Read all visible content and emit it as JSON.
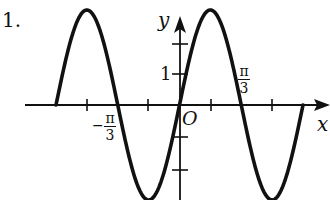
{
  "problem_label": "1.",
  "axes": {
    "x_label": "x",
    "y_label": "y",
    "origin_label": "O",
    "y_tick_label": "1",
    "x_tick_labels": [
      {
        "sign": "",
        "numerator": "π",
        "denominator": "3"
      },
      {
        "sign": "−",
        "numerator": "π",
        "denominator": "3"
      }
    ]
  },
  "colors": {
    "curve": "#111111",
    "axis": "#111111",
    "background": "#ffffff"
  },
  "chart_data": {
    "type": "line",
    "title": "",
    "xlabel": "x",
    "ylabel": "y",
    "function_form": "y = A sin(ωx + φ)",
    "estimated_amplitude": 3,
    "estimated_period": "2π/3 ... one period spans from −π/3 to π/3",
    "zero_crossings_labeled": [
      "-π/3",
      "π/3"
    ],
    "y_ticks": [
      2,
      1,
      -1,
      -2
    ],
    "y_tick_labels_shown": [
      "1"
    ],
    "x_tick_labels_shown": [
      "-π/3",
      "π/3"
    ],
    "grid": false,
    "legend": null,
    "key_points_px": {
      "x_axis_y": 105,
      "y_axis_x": 180,
      "peaks": [
        [
          87,
          10
        ],
        [
          210,
          10
        ]
      ],
      "troughs": [
        [
          148,
          199
        ],
        [
          270,
          199
        ]
      ],
      "zeros": [
        56,
        117,
        178,
        242,
        303
      ]
    }
  }
}
